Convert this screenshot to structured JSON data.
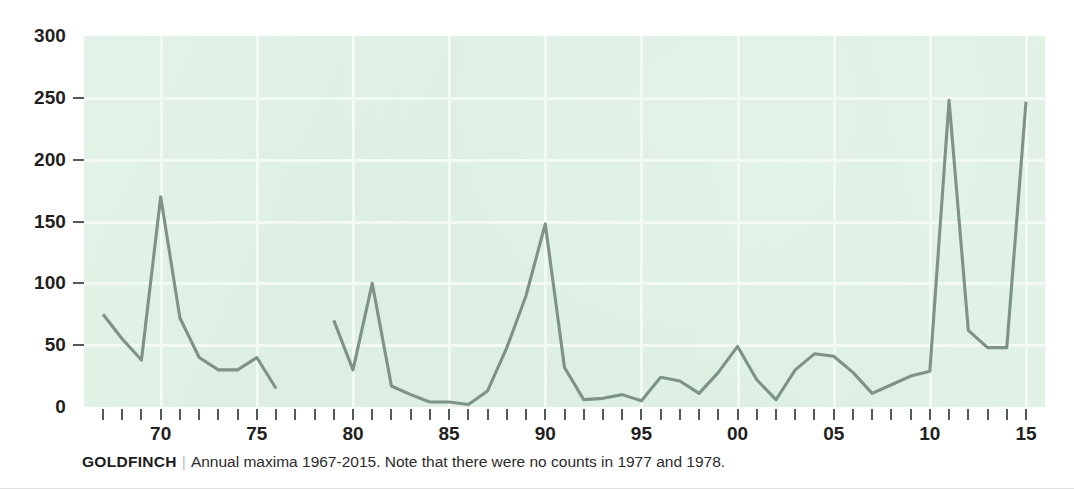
{
  "chart_data": {
    "type": "line",
    "title": "GOLDFINCH",
    "subtitle": "Annual maxima 1967-2015. Note that there were no counts in 1977 and 1978.",
    "xlabel": "",
    "ylabel": "",
    "xlim": [
      1967,
      2015
    ],
    "ylim": [
      0,
      300
    ],
    "grid": true,
    "legend": "none",
    "line_color": "#7f9289",
    "plot_background": "#dcefe2",
    "gridline_color": "#f3faf5",
    "x": [
      1967,
      1968,
      1969,
      1970,
      1971,
      1972,
      1973,
      1974,
      1975,
      1976,
      1977,
      1978,
      1979,
      1980,
      1981,
      1982,
      1983,
      1984,
      1985,
      1986,
      1987,
      1988,
      1989,
      1990,
      1991,
      1992,
      1993,
      1994,
      1995,
      1996,
      1997,
      1998,
      1999,
      2000,
      2001,
      2002,
      2003,
      2004,
      2005,
      2006,
      2007,
      2008,
      2009,
      2010,
      2011,
      2012,
      2013,
      2014,
      2015
    ],
    "values": [
      75,
      55,
      38,
      170,
      72,
      40,
      30,
      30,
      40,
      15,
      null,
      null,
      70,
      30,
      100,
      17,
      10,
      4,
      4,
      2,
      13,
      48,
      90,
      148,
      32,
      6,
      7,
      10,
      5,
      24,
      21,
      11,
      28,
      49,
      22,
      6,
      30,
      43,
      41,
      28,
      11,
      18,
      25,
      29,
      248,
      62,
      48,
      48,
      247
    ],
    "missing_years": [
      1977,
      1978
    ],
    "y_ticks": [
      0,
      50,
      100,
      150,
      200,
      250,
      300
    ],
    "y_tick_labels": [
      "0",
      "50",
      "100",
      "150",
      "200",
      "250",
      "300"
    ],
    "x_major_ticks": [
      1970,
      1975,
      1980,
      1985,
      1990,
      1995,
      2000,
      2005,
      2010,
      2015
    ],
    "x_major_labels": [
      "70",
      "75",
      "80",
      "85",
      "90",
      "95",
      "00",
      "05",
      "10",
      "15"
    ]
  },
  "caption": {
    "species": "GOLDFINCH",
    "divider": "|",
    "note": "Annual maxima 1967-2015. Note that there were no counts in 1977 and 1978."
  }
}
